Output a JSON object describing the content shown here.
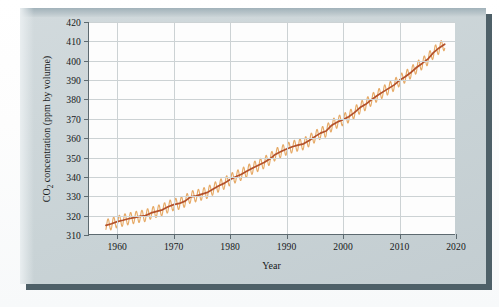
{
  "figure": {
    "panel_color": "#ccd5d8",
    "shadow_color": "#4e6068",
    "plot_background": "#fdfdfd"
  },
  "chart_data": {
    "type": "line",
    "title": "",
    "xlabel": "Year",
    "ylabel_prefix": "CO",
    "ylabel_sub": "2",
    "ylabel_suffix": " concentration (ppm by volume)",
    "ylabel": "CO2 concentration (ppm by volume)",
    "xlim": [
      1955,
      2020
    ],
    "ylim": [
      310,
      420
    ],
    "xticks": [
      1960,
      1970,
      1980,
      1990,
      2000,
      2010,
      2020
    ],
    "yticks": [
      310,
      320,
      330,
      340,
      350,
      360,
      370,
      380,
      390,
      400,
      410,
      420
    ],
    "grid": true,
    "legend": "none",
    "series": [
      {
        "name": "Monthly mean CO2 (seasonal oscillation)",
        "color": "#e5a55f",
        "description": "sawtooth seasonal cycle, amplitude approx 6 ppm peak-to-peak"
      },
      {
        "name": "Smoothed annual trend",
        "color": "#b3502a",
        "x": [
          1958,
          1959,
          1960,
          1961,
          1962,
          1963,
          1964,
          1965,
          1966,
          1967,
          1968,
          1969,
          1970,
          1971,
          1972,
          1973,
          1974,
          1975,
          1976,
          1977,
          1978,
          1979,
          1980,
          1981,
          1982,
          1983,
          1984,
          1985,
          1986,
          1987,
          1988,
          1989,
          1990,
          1991,
          1992,
          1993,
          1994,
          1995,
          1996,
          1997,
          1998,
          1999,
          2000,
          2001,
          2002,
          2003,
          2004,
          2005,
          2006,
          2007,
          2008,
          2009,
          2010,
          2011,
          2012,
          2013,
          2014,
          2015,
          2016,
          2017,
          2018
        ],
        "values": [
          315.0,
          315.8,
          316.9,
          317.6,
          318.4,
          319.0,
          319.6,
          320.0,
          321.4,
          322.2,
          323.0,
          324.6,
          325.7,
          326.3,
          327.5,
          329.7,
          330.2,
          331.1,
          332.0,
          333.8,
          335.4,
          336.8,
          338.7,
          340.1,
          341.4,
          343.0,
          344.6,
          346.0,
          347.4,
          349.2,
          351.6,
          353.1,
          354.4,
          355.6,
          356.4,
          357.1,
          358.8,
          360.8,
          362.6,
          363.7,
          366.7,
          368.4,
          369.6,
          371.1,
          373.2,
          375.8,
          377.5,
          379.8,
          381.9,
          383.8,
          385.6,
          387.4,
          389.9,
          391.7,
          393.9,
          396.5,
          398.6,
          400.8,
          404.2,
          406.6,
          408.5
        ]
      }
    ],
    "annotations": []
  },
  "axis_text": {
    "x_title": "Year",
    "y_title": "CO2 concentration (ppm by volume)"
  }
}
